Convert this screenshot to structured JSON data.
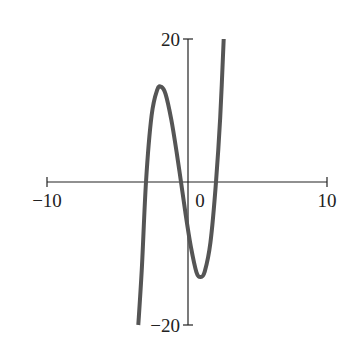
{
  "chart_data": {
    "type": "line",
    "title": "",
    "xlabel": "",
    "ylabel": "",
    "xlim": [
      -10,
      10
    ],
    "ylim": [
      -20,
      20
    ],
    "grid": false,
    "legend": null,
    "x_ticks": [
      {
        "value": -10,
        "label": "−10"
      },
      {
        "value": 0,
        "label": "0"
      },
      {
        "value": 10,
        "label": "10"
      }
    ],
    "y_ticks": [
      {
        "value": 20,
        "label": "20"
      },
      {
        "value": -20,
        "label": "−20"
      }
    ],
    "series": [
      {
        "name": "f(x)",
        "description": "cubic polynomial with roots near x=-3, x=-0.5, x=2; local max about (-1.9, 13), local min about (0.9, -14)",
        "color": "#555555",
        "x": [
          -3.55,
          -3.3,
          -3.0,
          -2.6,
          -2.2,
          -1.9,
          -1.6,
          -1.2,
          -0.8,
          -0.5,
          -0.2,
          0.2,
          0.6,
          0.9,
          1.2,
          1.6,
          2.0,
          2.3,
          2.55
        ],
        "y": [
          -20,
          -12.2,
          0,
          9.3,
          12.9,
          13.3,
          12.3,
          8.8,
          4.0,
          0,
          -4.1,
          -9.0,
          -12.6,
          -13.3,
          -12.5,
          -8.5,
          0,
          9.0,
          20
        ]
      }
    ]
  }
}
